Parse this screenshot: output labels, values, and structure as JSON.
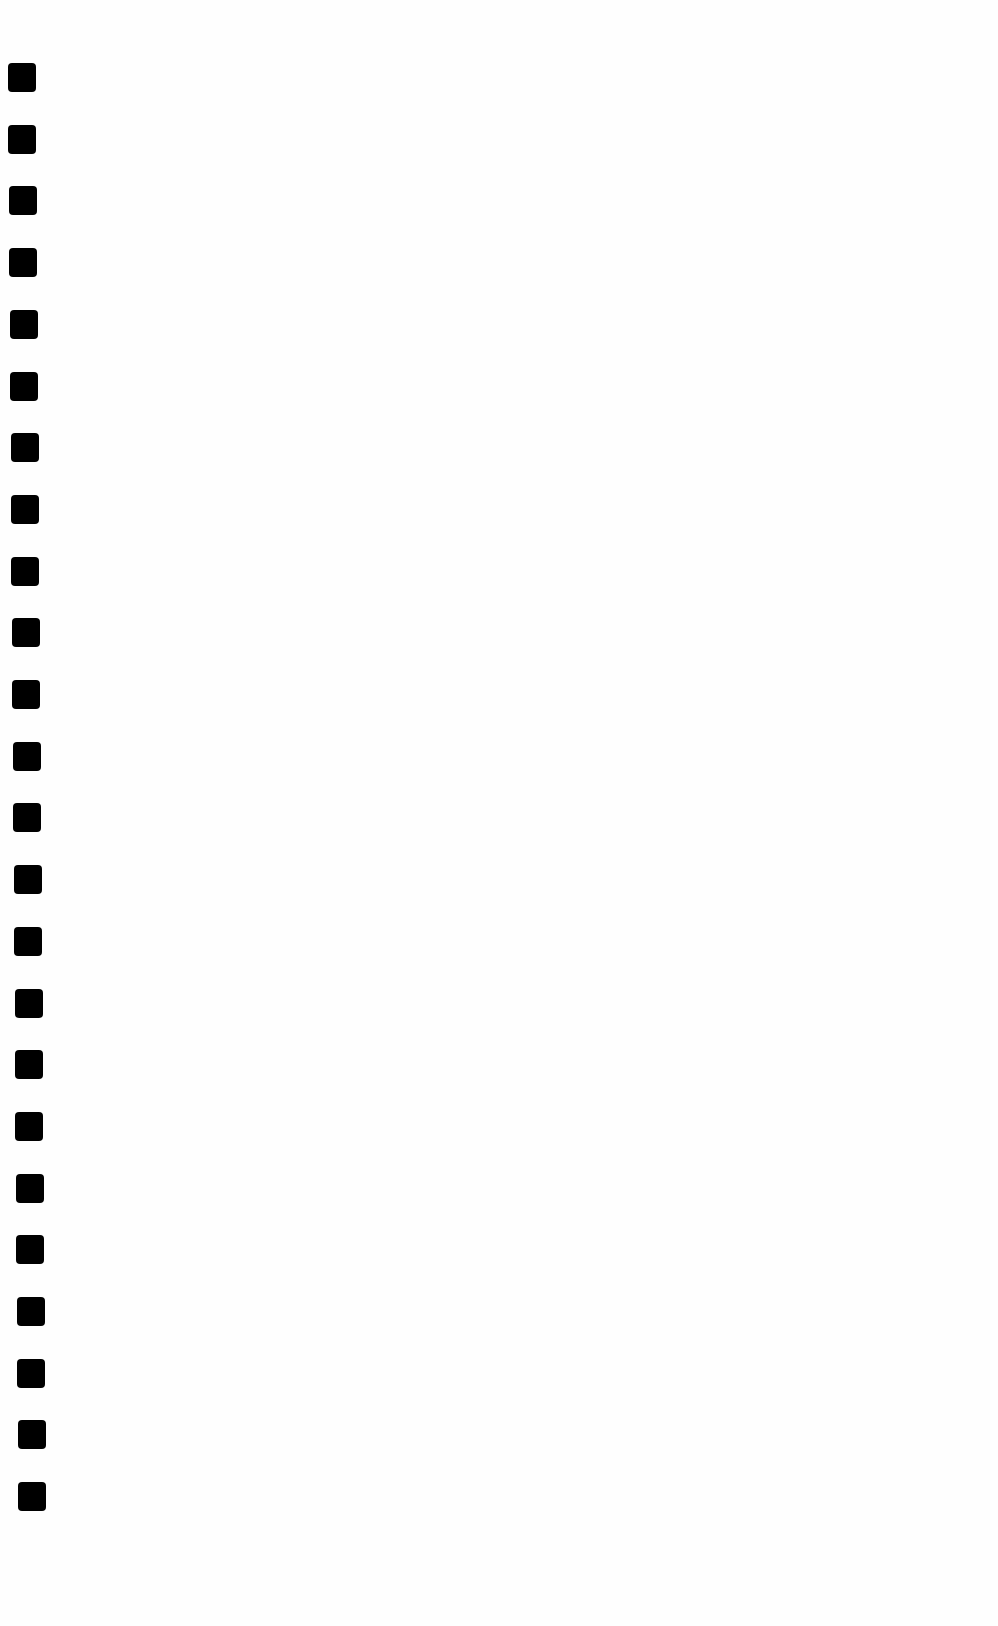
{
  "page": {
    "type": "continuous-feed paper scan",
    "background": "#fefefe",
    "feed_holes": {
      "count": 24,
      "color": "#000000",
      "size_px": [
        28,
        29
      ],
      "first_top": 63,
      "spacing": 61.7,
      "left_start": 8,
      "left_end": 18
    }
  }
}
